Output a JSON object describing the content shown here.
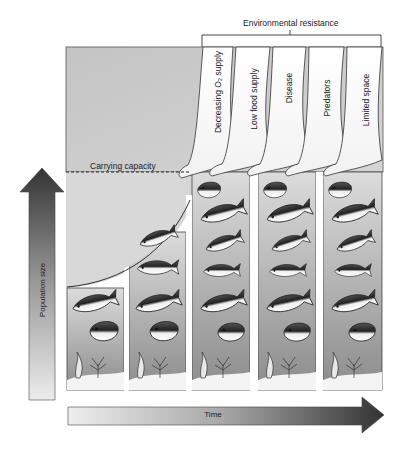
{
  "diagram": {
    "environmental_resistance": {
      "label": "Environmental resistance",
      "factors": [
        {
          "label": "Decreasing O₂ supply"
        },
        {
          "label": "Low food supply"
        },
        {
          "label": "Disease"
        },
        {
          "label": "Predators"
        },
        {
          "label": "Limited space"
        }
      ]
    },
    "carrying_capacity": {
      "label": "Carrying capacity"
    },
    "y_axis": {
      "label": "Population size"
    },
    "x_axis": {
      "label": "Time"
    },
    "columns": [
      {
        "index": 1,
        "fish_count": 2
      },
      {
        "index": 2,
        "fish_count": 4
      },
      {
        "index": 3,
        "fish_count": 6
      },
      {
        "index": 4,
        "fish_count": 6
      },
      {
        "index": 5,
        "fish_count": 6
      }
    ],
    "colors": {
      "background": "#ffffff",
      "top_region": "#c8c8c8",
      "water_top": "#d2d2d2",
      "water_bottom": "#8a8a8a",
      "arrow_dark": "#3a3a3a",
      "arrow_light": "#e4e4e4",
      "line": "#333333"
    }
  }
}
